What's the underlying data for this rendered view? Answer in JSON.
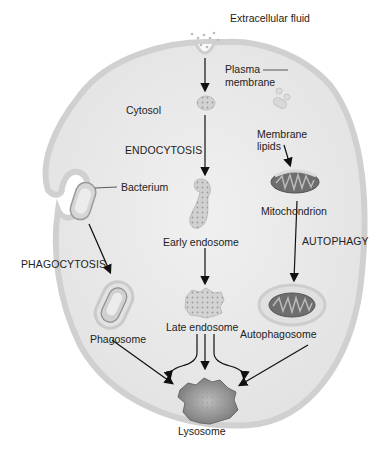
{
  "diagram": {
    "labels": {
      "extracellular_fluid": "Extracellular fluid",
      "plasma_membrane_line1": "Plasma",
      "plasma_membrane_line2": "membrane",
      "cytosol": "Cytosol",
      "endocytosis": "ENDOCYTOSIS",
      "bacterium": "Bacterium",
      "membrane_lipids_line1": "Membrane",
      "membrane_lipids_line2": "lipids",
      "mitochondrion": "Mitochondrion",
      "autophagy": "AUTOPHAGY",
      "phagocytosis": "PHAGOCYTOSIS",
      "early_endosome": "Early endosome",
      "late_endosome": "Late endosome",
      "phagosome": "Phagosome",
      "autophagosome": "Autophagosome",
      "lysosome": "Lysosome"
    },
    "pathways": [
      {
        "name": "ENDOCYTOSIS",
        "steps": [
          "Extracellular fluid",
          "Early endosome",
          "Late endosome",
          "Lysosome"
        ]
      },
      {
        "name": "PHAGOCYTOSIS",
        "steps": [
          "Bacterium",
          "Phagosome",
          "Lysosome"
        ]
      },
      {
        "name": "AUTOPHAGY",
        "steps": [
          "Mitochondrion",
          "Autophagosome",
          "Lysosome"
        ]
      }
    ],
    "colors": {
      "cell_fill": "#e9e9e9",
      "membrane": "#d4d4d4",
      "organelle_dark": "#6e6e6e",
      "arrow": "#111111",
      "text": "#222222"
    }
  }
}
